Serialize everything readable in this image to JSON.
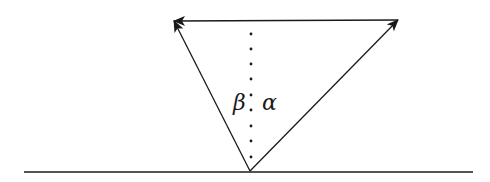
{
  "diagram": {
    "title": "",
    "colors": {
      "stroke": "#1a1a1a",
      "background": "#ffffff"
    },
    "points": {
      "apex": {
        "x": 250,
        "y": 171
      },
      "top_left": {
        "x": 174,
        "y": 21
      },
      "top_right": {
        "x": 398,
        "y": 20
      }
    },
    "baseline": {
      "x1": 24,
      "x2": 473,
      "y": 172
    },
    "dotted_normal": {
      "x": 251,
      "y_top": 34,
      "y_bottom": 160,
      "dot_spacing": 15.7
    },
    "arrows": [
      {
        "id": "apex-to-top-left",
        "from": "apex",
        "to": "top_left",
        "head": "end"
      },
      {
        "id": "top-right-to-top-left",
        "from": "top_right",
        "to": "top_left",
        "head": "end"
      },
      {
        "id": "apex-to-top-right",
        "from": "apex",
        "to": "top_right",
        "head": "end"
      }
    ],
    "labels": {
      "beta": {
        "text": "β",
        "x": 233,
        "y": 110
      },
      "separator": {
        "text": ".",
        "x": 248,
        "y": 110
      },
      "alpha": {
        "text": "α",
        "x": 262,
        "y": 110
      }
    }
  }
}
